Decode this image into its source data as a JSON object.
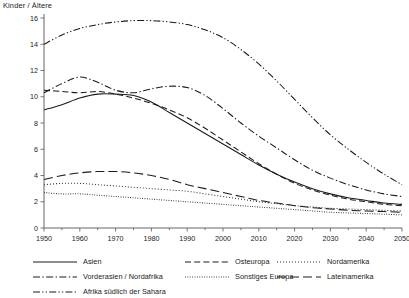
{
  "chart_data": {
    "type": "line",
    "title": "Kinder / Ältere",
    "xlabel": "",
    "ylabel": "",
    "xlim": [
      1950,
      2050
    ],
    "ylim": [
      0,
      16
    ],
    "ytick_step": 2,
    "xtick_step": 10,
    "xminor_step": 5,
    "grid": false,
    "legend_position": "below",
    "yticks": [
      "0",
      "2",
      "4",
      "6",
      "8",
      "10",
      "12",
      "14",
      "16"
    ],
    "xticks": [
      "1950",
      "1960",
      "1970",
      "1980",
      "1990",
      "2000",
      "2010",
      "2020",
      "2030",
      "2040",
      "2050"
    ],
    "x": [
      1950,
      1955,
      1960,
      1965,
      1970,
      1975,
      1980,
      1985,
      1990,
      1995,
      2000,
      2005,
      2010,
      2015,
      2020,
      2025,
      2030,
      2035,
      2040,
      2045,
      2050
    ],
    "series": [
      {
        "name": "Asien",
        "dash": "solid",
        "values": [
          9.0,
          9.4,
          9.9,
          10.2,
          10.2,
          10.1,
          9.6,
          8.8,
          8.0,
          7.2,
          6.4,
          5.6,
          4.8,
          4.1,
          3.5,
          3.0,
          2.6,
          2.3,
          2.1,
          1.9,
          1.8
        ]
      },
      {
        "name": "Vorderasien / Nordafrika",
        "dash": "dash-dot",
        "values": [
          10.3,
          11.0,
          11.5,
          11.1,
          10.5,
          10.3,
          10.6,
          10.8,
          10.7,
          10.1,
          9.1,
          8.0,
          7.0,
          6.1,
          5.2,
          4.4,
          3.8,
          3.3,
          2.9,
          2.6,
          2.4
        ]
      },
      {
        "name": "Afrika südlich der Sahara",
        "dash": "dash-dot-dot",
        "values": [
          14.0,
          14.7,
          15.2,
          15.5,
          15.7,
          15.8,
          15.8,
          15.7,
          15.5,
          15.1,
          14.5,
          13.6,
          12.5,
          11.2,
          9.8,
          8.4,
          7.1,
          6.0,
          5.0,
          4.1,
          3.3
        ]
      },
      {
        "name": "Osteuropa",
        "dash": "dashed",
        "values": [
          10.5,
          10.4,
          10.3,
          10.4,
          10.2,
          9.9,
          9.5,
          9.0,
          8.4,
          7.6,
          6.7,
          5.8,
          4.9,
          4.1,
          3.4,
          2.9,
          2.5,
          2.2,
          2.0,
          1.8,
          1.7
        ]
      },
      {
        "name": "Sonstiges Europa",
        "dash": "dotted-fine",
        "values": [
          2.7,
          2.6,
          2.6,
          2.5,
          2.4,
          2.3,
          2.2,
          2.1,
          2.0,
          1.9,
          1.8,
          1.7,
          1.6,
          1.5,
          1.4,
          1.3,
          1.2,
          1.15,
          1.1,
          1.05,
          1.0
        ]
      },
      {
        "name": "Nordamerika",
        "dash": "dotted",
        "values": [
          3.3,
          3.4,
          3.4,
          3.3,
          3.2,
          3.1,
          3.0,
          2.9,
          2.8,
          2.6,
          2.4,
          2.2,
          2.0,
          1.85,
          1.7,
          1.6,
          1.5,
          1.45,
          1.4,
          1.35,
          1.3
        ]
      },
      {
        "name": "Lateinamerika",
        "dash": "long-dash",
        "values": [
          3.7,
          4.0,
          4.2,
          4.3,
          4.3,
          4.2,
          4.0,
          3.7,
          3.3,
          3.0,
          2.7,
          2.4,
          2.1,
          1.9,
          1.7,
          1.55,
          1.45,
          1.35,
          1.3,
          1.25,
          1.2
        ]
      }
    ]
  },
  "legend": {
    "columns": [
      {
        "id": "col-a",
        "entries": [
          {
            "label": "Asien",
            "dash": "solid"
          },
          {
            "label": "Vorderasien / Nordafrika",
            "dash": "dash-dot"
          },
          {
            "label": "Afrika südlich der Sahara",
            "dash": "dash-dot-dot"
          }
        ]
      },
      {
        "id": "col-b",
        "entries": [
          {
            "label": "Osteuropa",
            "dash": "dashed"
          },
          {
            "label": "Sonstiges Europa",
            "dash": "dotted-fine"
          }
        ]
      },
      {
        "id": "col-c",
        "entries": [
          {
            "label": "Nordamerika",
            "dash": "dotted"
          },
          {
            "label": "Lateinamerika",
            "dash": "long-dash"
          }
        ]
      }
    ]
  }
}
